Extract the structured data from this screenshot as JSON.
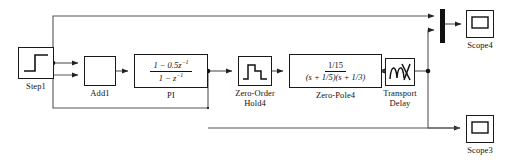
{
  "diagram": {
    "background_color": "#ffffff",
    "line_color": "#555555",
    "border_color": "#1a1a1a",
    "blocks": [
      {
        "id": "step1",
        "label": "Step1",
        "icon": "step-icon",
        "x": 18,
        "y": 47,
        "w": 36,
        "h": 32,
        "label_x": 8,
        "label_y": 82,
        "label_w": 56
      },
      {
        "id": "add1",
        "label": "Add1",
        "icon": "empty-sum-icon",
        "x": 84,
        "y": 56,
        "w": 32,
        "h": 30,
        "label_x": 58,
        "label_y": 89,
        "label_w": 84
      },
      {
        "id": "pi",
        "label": "PI",
        "icon": "discrete-transfer-function-icon",
        "numerator": "1 − 0.5z",
        "numerator_exp": "−1",
        "denominator": "1 − z",
        "denominator_exp": "−1",
        "x": 134,
        "y": 54,
        "w": 74,
        "h": 34,
        "label_x": 134,
        "label_y": 91,
        "label_w": 74
      },
      {
        "id": "zero-order-hold4",
        "label": "Zero-Order\nHold4",
        "icon": "staircase-hold-icon",
        "x": 238,
        "y": 56,
        "w": 34,
        "h": 30,
        "label_x": 220,
        "label_y": 89,
        "label_w": 70
      },
      {
        "id": "zero-pole4",
        "label": "Zero-Pole4",
        "icon": "continuous-transfer-function-icon",
        "numerator": "1/15",
        "denominator": "(s + 1/5)(s + 1/3)",
        "x": 289,
        "y": 54,
        "w": 93,
        "h": 34,
        "label_x": 289,
        "label_y": 91,
        "label_w": 93
      },
      {
        "id": "transport-delay",
        "label": "Transport\nDelay",
        "icon": "transport-delay-icon",
        "x": 385,
        "y": 58,
        "w": 30,
        "h": 28,
        "label_x": 370,
        "label_y": 89,
        "label_w": 60
      },
      {
        "id": "mux",
        "label": "",
        "icon": "mux-bar-icon",
        "x": 440,
        "y": 9,
        "w": 5,
        "h": 34
      },
      {
        "id": "scope4",
        "label": "Scope4",
        "icon": "scope-icon",
        "x": 466,
        "y": 10,
        "w": 28,
        "h": 28,
        "label_x": 452,
        "label_y": 41,
        "label_w": 56
      },
      {
        "id": "scope3",
        "label": "Scope3",
        "icon": "scope-icon",
        "x": 466,
        "y": 115,
        "w": 28,
        "h": 28,
        "label_x": 452,
        "label_y": 146,
        "label_w": 56
      }
    ],
    "signals": [
      {
        "id": "step1-to-branch",
        "from": "step1",
        "to": "branch-a"
      },
      {
        "id": "branch-a-to-add1",
        "from": "branch-a",
        "to": "add1"
      },
      {
        "id": "branch-a-to-mux",
        "from": "branch-a",
        "to": "mux"
      },
      {
        "id": "add1-to-pi",
        "from": "add1",
        "to": "pi"
      },
      {
        "id": "pi-to-branch-b",
        "from": "pi",
        "to": "branch-b"
      },
      {
        "id": "branch-b-to-zoh",
        "from": "branch-b",
        "to": "zero-order-hold4"
      },
      {
        "id": "branch-b-feedback-to-add1",
        "from": "branch-b",
        "to": "add1"
      },
      {
        "id": "zoh-to-zero-pole4",
        "from": "zero-order-hold4",
        "to": "zero-pole4"
      },
      {
        "id": "zero-pole4-to-transport-delay",
        "from": "zero-pole4",
        "to": "transport-delay"
      },
      {
        "id": "transport-delay-to-branch-c",
        "from": "transport-delay",
        "to": "branch-c"
      },
      {
        "id": "branch-c-to-mux",
        "from": "branch-c",
        "to": "mux"
      },
      {
        "id": "branch-c-to-scope3",
        "from": "branch-c",
        "to": "scope3"
      },
      {
        "id": "mux-to-scope4",
        "from": "mux",
        "to": "scope4"
      }
    ]
  }
}
